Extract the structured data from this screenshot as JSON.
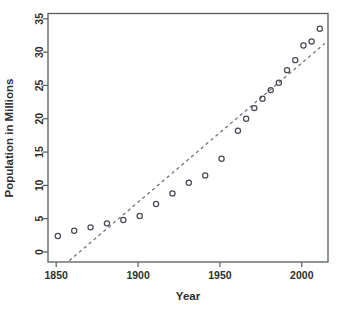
{
  "chart_data": {
    "type": "scatter",
    "title": "",
    "subtitle": "",
    "xlabel": "Year",
    "ylabel": "Population in Millions",
    "xlim": [
      1845,
      2016
    ],
    "ylim": [
      -1.5,
      35.8
    ],
    "grid": false,
    "legend": false,
    "legend_position": "none",
    "xticks": [
      1850,
      1900,
      1950,
      2000
    ],
    "xticklabels": [
      "1850",
      "1900",
      "1950",
      "2000"
    ],
    "yticks": [
      0,
      5,
      10,
      15,
      20,
      25,
      30,
      35
    ],
    "yticklabels": [
      "0",
      "5",
      "10",
      "15",
      "20",
      "25",
      "30",
      "35"
    ],
    "marker": "open-circle",
    "marker_color": "#4b4b55",
    "series": [
      {
        "name": "Population",
        "x": [
          1851,
          1861,
          1871,
          1881,
          1891,
          1901,
          1911,
          1921,
          1931,
          1941,
          1951,
          1961,
          1966,
          1971,
          1976,
          1981,
          1986,
          1991,
          1996,
          2001,
          2006,
          2011
        ],
        "values": [
          2.4,
          3.2,
          3.7,
          4.3,
          4.8,
          5.4,
          7.2,
          8.8,
          10.4,
          11.5,
          14.0,
          18.2,
          20.0,
          21.6,
          23.0,
          24.3,
          25.4,
          27.3,
          28.8,
          31.0,
          31.6,
          33.5
        ]
      }
    ],
    "annotations": [
      {
        "name": "linear-fit-line",
        "type": "dashed-line",
        "x_start": 1858,
        "y_start": -1.3,
        "x_end": 2014,
        "y_end": 31.3,
        "color": "#6e6e78",
        "style": "dashed"
      }
    ]
  },
  "axes": {
    "x_title": "Year",
    "y_title": "Population in Millions"
  }
}
